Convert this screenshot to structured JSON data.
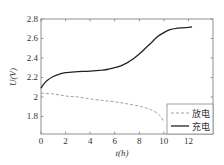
{
  "chart_data": {
    "type": "line",
    "title": "",
    "xlabel": "t(h)",
    "ylabel": "U(V)",
    "xlim": [
      0,
      14
    ],
    "ylim": [
      1.62,
      2.8
    ],
    "xticks": [
      0,
      2,
      4,
      6,
      8,
      10,
      12
    ],
    "yticks": [
      1.8,
      2.0,
      2.2,
      2.4,
      2.6,
      2.8
    ],
    "xtick_labels": [
      "0",
      "2",
      "4",
      "6",
      "8",
      "10",
      "12"
    ],
    "ytick_labels": [
      "1.8",
      "2",
      "2.2",
      "2.4",
      "2.6",
      "2.8"
    ],
    "grid": false,
    "legend_position": "lower right",
    "series": [
      {
        "name": "放电",
        "style": "dashed",
        "color": "#888888",
        "x": [
          0,
          1,
          2,
          3,
          4,
          5,
          6,
          7,
          8,
          8.5,
          9,
          9.5,
          9.8,
          10.0
        ],
        "y": [
          2.04,
          2.03,
          2.01,
          2.0,
          1.98,
          1.965,
          1.95,
          1.93,
          1.905,
          1.89,
          1.865,
          1.83,
          1.79,
          1.74
        ]
      },
      {
        "name": "充电",
        "style": "solid",
        "color": "#222222",
        "x": [
          0,
          0.2,
          0.5,
          1,
          1.5,
          2,
          3,
          4,
          5,
          5.5,
          6,
          6.5,
          7,
          7.5,
          8,
          8.5,
          9,
          9.5,
          10,
          10.5,
          11,
          11.5,
          12,
          12.3
        ],
        "y": [
          2.09,
          2.13,
          2.17,
          2.21,
          2.235,
          2.25,
          2.26,
          2.265,
          2.275,
          2.285,
          2.3,
          2.32,
          2.35,
          2.39,
          2.44,
          2.5,
          2.56,
          2.62,
          2.66,
          2.69,
          2.705,
          2.71,
          2.715,
          2.72
        ]
      }
    ]
  }
}
